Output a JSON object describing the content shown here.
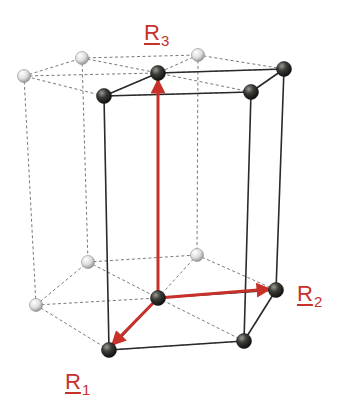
{
  "diagram": {
    "colors": {
      "vector": "#c8302a",
      "solid_edge": "#2a2a2a",
      "dashed_edge": "#7a7a7a",
      "dark_atom": "#2f2f2c",
      "light_atom": "#e6e6e6"
    },
    "labels": [
      {
        "id": "R3",
        "base": "R",
        "sub": "3",
        "x": 144,
        "y": 22
      },
      {
        "id": "R2",
        "base": "R",
        "sub": "2",
        "x": 297,
        "y": 283
      },
      {
        "id": "R1",
        "base": "R",
        "sub": "1",
        "x": 65,
        "y": 371
      }
    ],
    "atoms": {
      "top": {
        "far_left": {
          "x": 24,
          "y": 76,
          "type": "light"
        },
        "back_left": {
          "x": 82,
          "y": 58,
          "type": "light"
        },
        "back_right": {
          "x": 198,
          "y": 55,
          "type": "light"
        },
        "center": {
          "x": 158,
          "y": 73,
          "type": "dark"
        },
        "right": {
          "x": 284,
          "y": 69,
          "type": "dark"
        },
        "front_left": {
          "x": 104,
          "y": 96,
          "type": "dark"
        },
        "front_right": {
          "x": 251,
          "y": 92,
          "type": "dark"
        }
      },
      "bottom": {
        "far_left": {
          "x": 36,
          "y": 305,
          "type": "light"
        },
        "back_left": {
          "x": 88,
          "y": 262,
          "type": "light"
        },
        "back_right": {
          "x": 197,
          "y": 255,
          "type": "light"
        },
        "center": {
          "x": 158,
          "y": 298,
          "type": "dark"
        },
        "right": {
          "x": 276,
          "y": 290,
          "type": "dark"
        },
        "front_left": {
          "x": 109,
          "y": 350,
          "type": "dark"
        },
        "front_right": {
          "x": 244,
          "y": 341,
          "type": "dark"
        }
      }
    },
    "vectors": [
      {
        "name": "R1",
        "from": [
          158,
          298
        ],
        "to": [
          112,
          345
        ]
      },
      {
        "name": "R2",
        "from": [
          158,
          298
        ],
        "to": [
          270,
          289
        ]
      },
      {
        "name": "R3",
        "from": [
          158,
          298
        ],
        "to": [
          158,
          80
        ]
      }
    ]
  }
}
